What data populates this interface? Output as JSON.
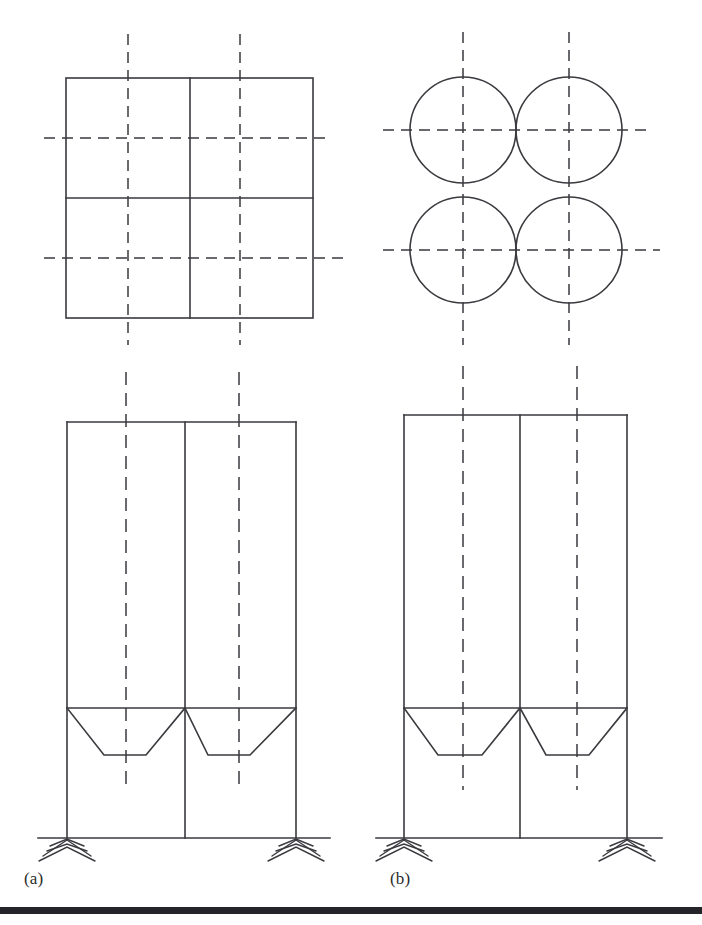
{
  "figure": {
    "width": 702,
    "height": 925,
    "background_color": "#ffffff",
    "line_color": "#3a3a3f",
    "centerline_color": "#3a3a3f",
    "footer_rule_color": "#24242a"
  },
  "captions": [
    {
      "id": "a",
      "label": "(a)",
      "x": 24,
      "y": 869,
      "describes": "square-cell silo group"
    },
    {
      "id": "b",
      "label": "(b)",
      "x": 390,
      "y": 869,
      "describes": "circular-cell silo group"
    }
  ],
  "panels": [
    {
      "id": "panel-a",
      "label": "(a)",
      "cell_shape": "square",
      "plan": {
        "type": "square-grid-plan",
        "outer": {
          "x": 66,
          "y": 78,
          "width": 247,
          "height": 240
        },
        "divider_vertical_x": 190,
        "divider_horizontal_y": 198,
        "cell_count": 4,
        "cell_centerlines_vertical_x": [
          128,
          240
        ],
        "cell_centerlines_horizontal_y": [
          138,
          258
        ]
      },
      "elevation": {
        "type": "silo-elevation",
        "left_x": 67,
        "right_x": 296,
        "middle_wall_x": 185,
        "top_y": 422,
        "ground_y": 838,
        "hopper_top_y": 708,
        "hopper_outlet_y": 755,
        "hoppers": [
          {
            "top_left_x": 67,
            "top_right_x": 185,
            "outlet_left_x": 104,
            "outlet_right_x": 146
          },
          {
            "top_left_x": 185,
            "top_right_x": 296,
            "outlet_left_x": 208,
            "outlet_right_x": 250
          }
        ],
        "centerlines_x": [
          126,
          239
        ],
        "supports": [
          {
            "x": 67,
            "type": "fixed-hatched-support"
          },
          {
            "x": 296,
            "type": "fixed-hatched-support"
          }
        ]
      }
    },
    {
      "id": "panel-b",
      "label": "(b)",
      "cell_shape": "circular",
      "plan": {
        "type": "circle-cluster-plan",
        "circle_radius": 53,
        "circles": [
          {
            "cx": 463,
            "cy": 130
          },
          {
            "cx": 569,
            "cy": 130
          },
          {
            "cx": 463,
            "cy": 250
          },
          {
            "cx": 569,
            "cy": 250
          }
        ],
        "cell_count": 4,
        "cell_centerlines_vertical_x": [
          463,
          569
        ],
        "cell_centerlines_horizontal_y": [
          130,
          250
        ]
      },
      "elevation": {
        "type": "silo-elevation",
        "left_x": 404,
        "right_x": 627,
        "middle_wall_x": 520,
        "top_y": 415,
        "ground_y": 838,
        "hopper_top_y": 708,
        "hopper_outlet_y": 755,
        "hoppers": [
          {
            "top_left_x": 404,
            "top_right_x": 520,
            "outlet_left_x": 438,
            "outlet_right_x": 482
          },
          {
            "top_left_x": 520,
            "top_right_x": 627,
            "outlet_left_x": 546,
            "outlet_right_x": 589
          }
        ],
        "centerlines_x": [
          463,
          577
        ],
        "supports": [
          {
            "x": 404,
            "type": "fixed-hatched-support"
          },
          {
            "x": 627,
            "type": "fixed-hatched-support"
          }
        ]
      }
    }
  ],
  "legend": {
    "centerline_style": "dash-dot axis line",
    "support_symbol": "hatched ground (fixed support)"
  }
}
